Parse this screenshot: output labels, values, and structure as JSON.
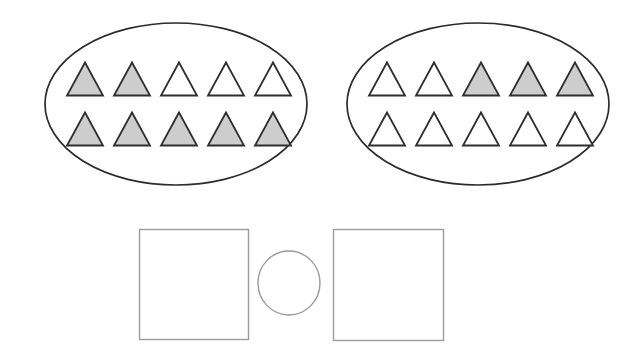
{
  "canvas": {
    "width": 633,
    "height": 354,
    "background": "#ffffff"
  },
  "colors": {
    "oval_stroke": "#2b2b2b",
    "triangle_stroke": "#2e2e2e",
    "triangle_shaded_fill": "#cdcdcd",
    "triangle_unshaded_fill": "#ffffff",
    "box_stroke": "#9b9b9b",
    "circle_stroke": "#9b9b9b",
    "box_fill": "#ffffff"
  },
  "worksheet": {
    "type": "compare-shaded-fractions",
    "groups": [
      {
        "name": "left-group",
        "shape": "oval",
        "cx": 176,
        "cy": 104,
        "rx": 131,
        "ry": 81,
        "total_triangles": 10,
        "shaded_count": 7,
        "unshaded_count": 3,
        "fraction_shaded": "7/10",
        "rows": [
          {
            "row_index": 0,
            "y": 79,
            "start_x": 85,
            "spacing": 47,
            "states": [
              "shaded",
              "shaded",
              "unshaded",
              "unshaded",
              "unshaded"
            ]
          },
          {
            "row_index": 1,
            "y": 129,
            "start_x": 85,
            "spacing": 47,
            "states": [
              "shaded",
              "shaded",
              "shaded",
              "shaded",
              "shaded"
            ]
          }
        ]
      },
      {
        "name": "right-group",
        "shape": "oval",
        "cx": 478,
        "cy": 104,
        "rx": 131,
        "ry": 81,
        "total_triangles": 10,
        "shaded_count": 3,
        "unshaded_count": 7,
        "fraction_shaded": "3/10",
        "rows": [
          {
            "row_index": 0,
            "y": 79,
            "start_x": 387,
            "spacing": 47,
            "states": [
              "unshaded",
              "unshaded",
              "shaded",
              "shaded",
              "shaded"
            ]
          },
          {
            "row_index": 1,
            "y": 129,
            "start_x": 387,
            "spacing": 47,
            "states": [
              "unshaded",
              "unshaded",
              "unshaded",
              "unshaded",
              "unshaded"
            ]
          }
        ]
      }
    ],
    "triangle": {
      "width": 36,
      "height": 33
    },
    "answer_area": {
      "left_box": {
        "name": "left-answer-box",
        "x": 139,
        "y": 229,
        "width": 109,
        "height": 110,
        "value": ""
      },
      "operator_circle": {
        "name": "operator-circle",
        "cx": 289,
        "cy": 283,
        "rx": 31,
        "ry": 32,
        "value": ""
      },
      "right_box": {
        "name": "right-answer-box",
        "x": 333,
        "y": 229,
        "width": 110,
        "height": 111,
        "value": ""
      }
    }
  }
}
